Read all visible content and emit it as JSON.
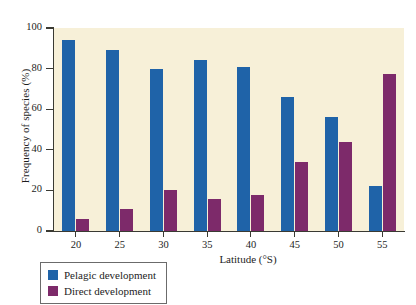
{
  "chart_data": {
    "type": "bar",
    "title": "",
    "xlabel": "Latitude (°S)",
    "ylabel": "Frequency of species (%)",
    "categories": [
      "20",
      "25",
      "30",
      "35",
      "40",
      "45",
      "50",
      "55"
    ],
    "series": [
      {
        "name": "Pelagic development",
        "color": "#1f63a8",
        "values": [
          94,
          89,
          80,
          84,
          81,
          66,
          56,
          22
        ]
      },
      {
        "name": "Direct development",
        "color": "#7d2a6a",
        "values": [
          6,
          11,
          20,
          16,
          17.5,
          34,
          44,
          77.5
        ]
      }
    ],
    "ylim": [
      0,
      100
    ],
    "yticks": [
      0,
      20,
      40,
      60,
      80,
      100
    ],
    "ytick_labels": [
      "0",
      "20",
      "40",
      "60",
      "80",
      "100"
    ],
    "xtick_labels": [
      "20",
      "25",
      "30",
      "35",
      "40",
      "45",
      "50",
      "55"
    ],
    "grid": false,
    "legend_position": "below-left",
    "plot_background": "#f7f0d8",
    "figure_background": "#ffffff",
    "axis_color": "#3a3a33"
  },
  "legend": {
    "items": [
      {
        "label": "Pelagic development",
        "color": "#1f63a8"
      },
      {
        "label": "Direct development",
        "color": "#7d2a6a"
      }
    ]
  }
}
